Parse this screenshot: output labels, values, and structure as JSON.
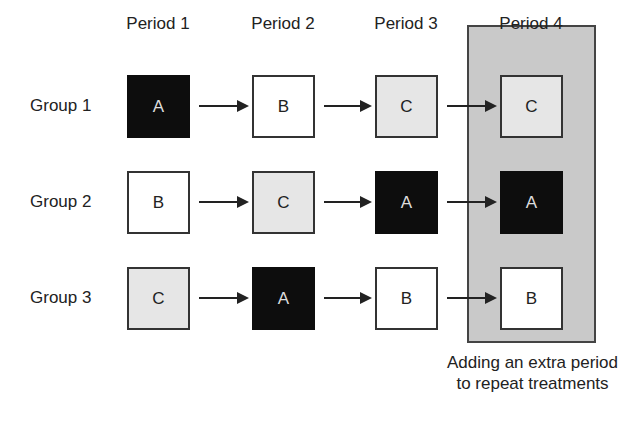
{
  "periods": [
    "Period 1",
    "Period 2",
    "Period 3",
    "Period 4"
  ],
  "groups": [
    {
      "label": "Group 1",
      "treatments": [
        "A",
        "B",
        "C",
        "C"
      ],
      "tones": [
        "black",
        "white",
        "light",
        "light"
      ]
    },
    {
      "label": "Group 2",
      "treatments": [
        "B",
        "C",
        "A",
        "A"
      ],
      "tones": [
        "white",
        "light",
        "black",
        "black"
      ]
    },
    {
      "label": "Group 3",
      "treatments": [
        "C",
        "A",
        "B",
        "B"
      ],
      "tones": [
        "light",
        "black",
        "white",
        "white"
      ]
    }
  ],
  "highlight_panel": {
    "period": "Period 4",
    "caption": "Adding an extra period to repeat treatments"
  },
  "legend_colors": {
    "A": "#0d0d0d",
    "B": "#ffffff",
    "C": "#e6e6e6",
    "panel": "#c9c9c9"
  }
}
